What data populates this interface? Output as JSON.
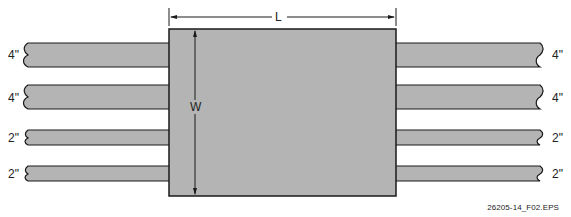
{
  "diagram": {
    "dimension_length_label": "L",
    "dimension_width_label": "W",
    "pipes": [
      {
        "side": "left",
        "size": "4\"",
        "top": 43,
        "height": 24
      },
      {
        "side": "left",
        "size": "4\"",
        "top": 85,
        "height": 24
      },
      {
        "side": "left",
        "size": "2\"",
        "top": 130,
        "height": 15
      },
      {
        "side": "left",
        "size": "2\"",
        "top": 166,
        "height": 15
      },
      {
        "side": "right",
        "size": "4\"",
        "top": 43,
        "height": 24
      },
      {
        "side": "right",
        "size": "4\"",
        "top": 85,
        "height": 24
      },
      {
        "side": "right",
        "size": "2\"",
        "top": 130,
        "height": 15
      },
      {
        "side": "right",
        "size": "2\"",
        "top": 166,
        "height": 15
      }
    ],
    "figure_id": "26205-14_F02.EPS",
    "colors": {
      "fill": "#b4b4b4",
      "stroke": "#1a1a1a"
    }
  }
}
